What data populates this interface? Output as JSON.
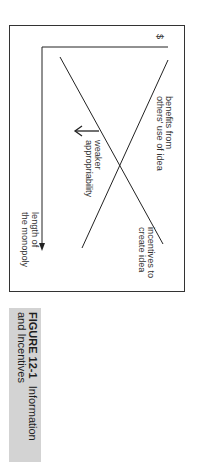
{
  "figure": {
    "orientation": "rotated-90-clockwise",
    "axes": {
      "y_label": "$",
      "x_label_line1": "length of",
      "x_label_line2": "the monopoly"
    },
    "curves": [
      {
        "name": "benefits",
        "label_line1": "benefits from",
        "label_line2": "others' use of idea",
        "direction": "decreasing"
      },
      {
        "name": "incentives",
        "label_line1": "incentives to",
        "label_line2": "create idea",
        "direction": "increasing"
      }
    ],
    "shift_annotation": {
      "label_line1": "weaker",
      "label_line2": "appropriability",
      "arrow_direction": "left-shift of incentives curve"
    },
    "colors": {
      "line": "#222222",
      "frame": "#333333",
      "caption_bg": "#d3d3d3",
      "text": "#333333"
    }
  },
  "caption": {
    "figure_number": "FIGURE 12-1",
    "title_part1": "Information",
    "title_part2": "and Incentives"
  }
}
